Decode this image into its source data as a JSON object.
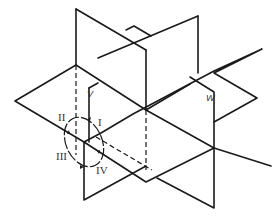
{
  "diagram": {
    "planes": {
      "v_label": "V",
      "w_label": "W"
    },
    "quadrants": {
      "q1": "I",
      "q2": "II",
      "q3": "III",
      "q4": "IV"
    },
    "colors": {
      "line": "#1a1a1a",
      "background": "#ffffff"
    }
  }
}
